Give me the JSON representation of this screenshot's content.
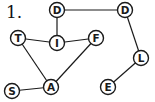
{
  "problem": {
    "number_label": "1."
  },
  "graph": {
    "node_radius": 7.5,
    "stroke_color": "#1a1a1a",
    "fill_color": "#ffffff",
    "nodes": [
      {
        "id": "D1",
        "label": "D",
        "x": 57,
        "y": 10
      },
      {
        "id": "D2",
        "label": "D",
        "x": 125,
        "y": 10
      },
      {
        "id": "T",
        "label": "T",
        "x": 18,
        "y": 38
      },
      {
        "id": "I",
        "label": "I",
        "x": 57,
        "y": 43
      },
      {
        "id": "F",
        "label": "F",
        "x": 96,
        "y": 38
      },
      {
        "id": "L",
        "label": "L",
        "x": 141,
        "y": 58
      },
      {
        "id": "S",
        "label": "S",
        "x": 12,
        "y": 91
      },
      {
        "id": "A",
        "label": "A",
        "x": 51,
        "y": 87
      },
      {
        "id": "E",
        "label": "E",
        "x": 108,
        "y": 87
      }
    ],
    "edges": [
      [
        "D1",
        "D2"
      ],
      [
        "D1",
        "I"
      ],
      [
        "T",
        "I"
      ],
      [
        "I",
        "F"
      ],
      [
        "T",
        "A"
      ],
      [
        "F",
        "A"
      ],
      [
        "S",
        "A"
      ],
      [
        "D2",
        "L"
      ],
      [
        "L",
        "E"
      ]
    ]
  }
}
